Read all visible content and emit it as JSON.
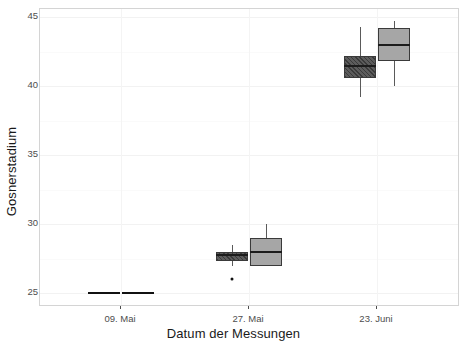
{
  "chart_data": {
    "type": "box",
    "title": "",
    "subtitle": "",
    "xlabel": "Datum der Messungen",
    "ylabel": "Gosnerstadium",
    "categories": [
      "09. Mai",
      "27. Mai",
      "23. Juni"
    ],
    "ylim": [
      24.0,
      45.6
    ],
    "yticks": [
      25,
      30,
      35,
      40,
      45
    ],
    "ytick_labels": [
      "25",
      "30",
      "35",
      "40",
      "45"
    ],
    "grid": true,
    "legend": "none",
    "colors": {
      "series_dark": "#4a4a4a",
      "series_light": "#a6a6a6",
      "outline": "#3a3a3a",
      "median": "#1c1c1c",
      "panel_background": "#ffffff",
      "panel_border": "#d4d4d4",
      "gridline": "#f2f2f2",
      "text": "#4d4d4d",
      "axis_title": "#1a1a1a"
    },
    "series": [
      {
        "name": "Gruppe 1",
        "fill": "dark-hatched",
        "boxes": [
          {
            "category": "09. Mai",
            "min": 25.0,
            "q1": 25.0,
            "median": 25.0,
            "q3": 25.0,
            "max": 25.0,
            "outliers": [],
            "degenerate": true
          },
          {
            "category": "27. Mai",
            "min": 27.0,
            "q1": 27.3,
            "median": 27.8,
            "q3": 28.0,
            "max": 28.5,
            "outliers": [
              26.0
            ],
            "degenerate": false
          },
          {
            "category": "23. Juni",
            "min": 39.2,
            "q1": 40.6,
            "median": 41.5,
            "q3": 42.2,
            "max": 44.3,
            "outliers": [],
            "degenerate": false
          }
        ]
      },
      {
        "name": "Gruppe 2",
        "fill": "light-solid",
        "boxes": [
          {
            "category": "09. Mai",
            "min": 25.0,
            "q1": 25.0,
            "median": 25.0,
            "q3": 25.0,
            "max": 25.0,
            "outliers": [],
            "degenerate": true
          },
          {
            "category": "27. Mai",
            "min": 27.0,
            "q1": 27.0,
            "median": 28.0,
            "q3": 29.0,
            "max": 30.0,
            "outliers": [],
            "degenerate": false
          },
          {
            "category": "23. Juni",
            "min": 40.0,
            "q1": 41.8,
            "median": 43.0,
            "q3": 44.2,
            "max": 44.7,
            "outliers": [],
            "degenerate": false
          }
        ]
      }
    ]
  },
  "layout": {
    "panel": {
      "left": 39,
      "top": 8,
      "width": 420,
      "height": 298
    },
    "plot_value_top": 45.6,
    "plot_value_bottom": 24.0,
    "category_centers_px": [
      120,
      248,
      376
    ],
    "box_half_width_px": 33,
    "box_gap_px": 1
  }
}
